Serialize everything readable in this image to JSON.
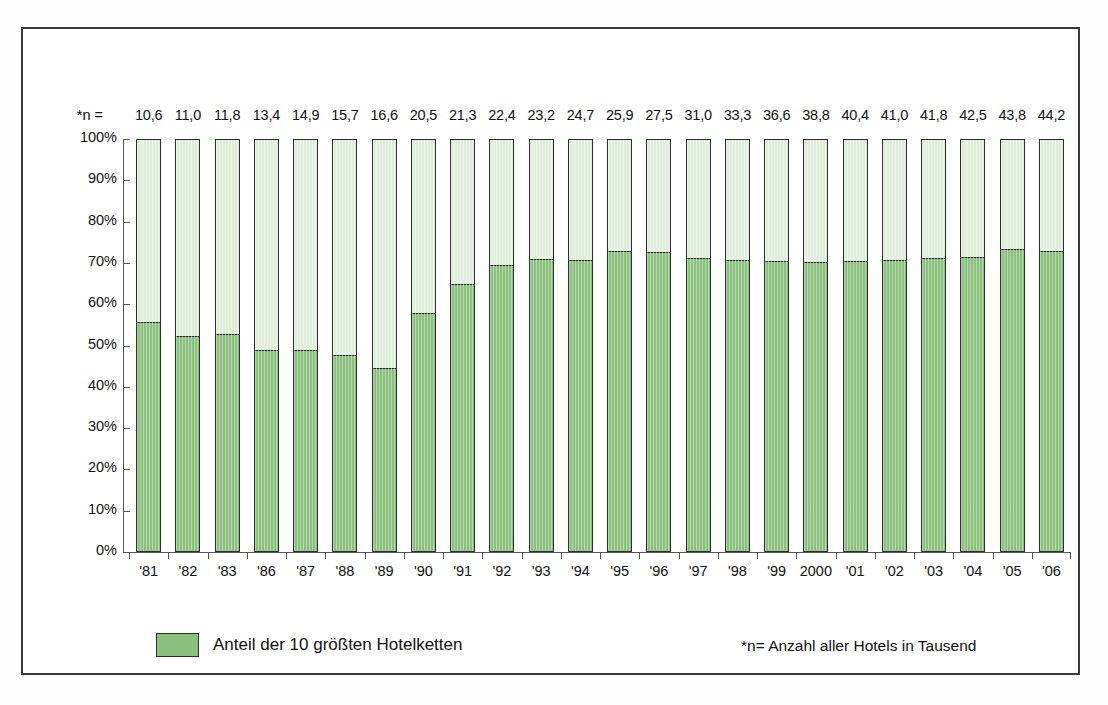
{
  "chart_data": {
    "type": "bar",
    "subtype": "stacked-100-percent",
    "title": "",
    "xlabel": "",
    "ylabel": "",
    "ylim": [
      0,
      100
    ],
    "ytick_labels": [
      "100%",
      "90%",
      "80%",
      "70%",
      "60%",
      "50%",
      "40%",
      "30%",
      "20%",
      "10%",
      "0%"
    ],
    "ytick_values": [
      100,
      90,
      80,
      70,
      60,
      50,
      40,
      30,
      20,
      10,
      0
    ],
    "grid": false,
    "legend_position": "bottom-left",
    "categories": [
      "'81",
      "'82",
      "'83",
      "'86",
      "'87",
      "'88",
      "'89",
      "'90",
      "'91",
      "'92",
      "'93",
      "'94",
      "'95",
      "'96",
      "'97",
      "'98",
      "'99",
      "2000",
      "'01",
      "'02",
      "'03",
      "'04",
      "'05",
      "'06"
    ],
    "series": [
      {
        "name": "Anteil der 10 größten Hotelketten",
        "color": "#8cc07f",
        "values": [
          55.8,
          52.4,
          52.8,
          48.8,
          48.8,
          47.6,
          44.5,
          58.0,
          65.0,
          69.5,
          71.0,
          70.8,
          73.0,
          72.8,
          71.2,
          70.8,
          70.5,
          70.2,
          70.5,
          70.8,
          71.2,
          71.5,
          73.5,
          73.0
        ]
      },
      {
        "name": "Übrige",
        "color": "#dfeeda",
        "values": [
          44.2,
          47.6,
          47.2,
          51.2,
          51.2,
          52.4,
          55.5,
          42.0,
          35.0,
          30.5,
          29.0,
          29.2,
          27.0,
          27.2,
          28.8,
          29.2,
          29.5,
          29.8,
          29.5,
          29.2,
          28.8,
          28.5,
          26.5,
          27.0
        ]
      }
    ],
    "top_annotation_prefix": "*n =",
    "top_annotations": [
      "10,6",
      "11,0",
      "11,8",
      "13,4",
      "14,9",
      "15,7",
      "16,6",
      "20,5",
      "21,3",
      "22,4",
      "23,2",
      "24,7",
      "25,9",
      "27,5",
      "31,0",
      "33,3",
      "36,6",
      "38,8",
      "40,4",
      "41,0",
      "41,8",
      "42,5",
      "43,8",
      "44,2"
    ],
    "footnote": "*n= Anzahl aller Hotels in Tausend",
    "legend_entries": [
      {
        "label": "Anteil der 10 größten Hotelketten",
        "color": "#8cc07f"
      }
    ]
  },
  "colors": {
    "series_primary": "#8cc07f",
    "series_secondary": "#dfeeda",
    "outline": "#2d2d2d",
    "axis": "#555555",
    "frame": "#3a3a3a",
    "text": "#111111"
  }
}
